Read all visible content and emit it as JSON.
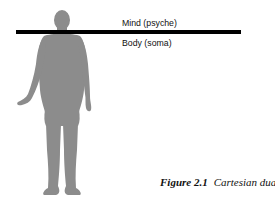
{
  "diagram": {
    "labels": {
      "mind": "Mind (psyche)",
      "body": "Body (soma)"
    },
    "caption": {
      "number": "Figure 2.1",
      "title": "Cartesian dualism"
    },
    "colors": {
      "silhouette": "#8c8c8c",
      "divider": "#000000"
    },
    "icons": {
      "figure": "human-silhouette-icon"
    }
  }
}
